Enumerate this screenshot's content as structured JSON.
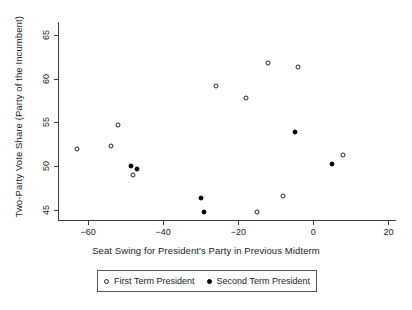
{
  "chart_data": {
    "type": "scatter",
    "title": "",
    "xlabel": "Seat Swing for President's Party in Previous Midterm",
    "ylabel": "Two-Party Vote Share (Party of the Incumbent)",
    "xlim": [
      -68,
      22
    ],
    "ylim": [
      43.8,
      66.5
    ],
    "xticks": [
      -60,
      -40,
      -20,
      0,
      20
    ],
    "xticklabels": [
      "−60",
      "−40",
      "−20",
      "0",
      "20"
    ],
    "yticks": [
      45,
      50,
      55,
      60,
      65
    ],
    "yticklabels": [
      "45",
      "50",
      "55",
      "60",
      "65"
    ],
    "grid": false,
    "legend_position": "below-axes",
    "series": [
      {
        "name": "First Term President",
        "marker": "open-circle",
        "color": "#222222",
        "points": [
          {
            "x": -63.0,
            "y": 51.9
          },
          {
            "x": -54.0,
            "y": 52.3
          },
          {
            "x": -52.0,
            "y": 54.7
          },
          {
            "x": -48.0,
            "y": 49.0
          },
          {
            "x": -26.0,
            "y": 59.2
          },
          {
            "x": -18.0,
            "y": 57.8
          },
          {
            "x": -12.0,
            "y": 61.8
          },
          {
            "x": -4.0,
            "y": 61.3
          },
          {
            "x": -8.0,
            "y": 46.5
          },
          {
            "x": -15.0,
            "y": 44.7
          },
          {
            "x": 8.0,
            "y": 51.2
          }
        ]
      },
      {
        "name": "Second Term President",
        "marker": "filled-circle",
        "color": "#000000",
        "points": [
          {
            "x": -48.5,
            "y": 50.0
          },
          {
            "x": -47.0,
            "y": 49.6
          },
          {
            "x": -30.0,
            "y": 46.3
          },
          {
            "x": -29.0,
            "y": 44.7
          },
          {
            "x": -5.0,
            "y": 53.9
          },
          {
            "x": 5.0,
            "y": 50.2
          }
        ]
      }
    ]
  },
  "legend": {
    "entries": [
      {
        "label": "First Term President",
        "marker": "open-circle"
      },
      {
        "label": "Second Term President",
        "marker": "filled-circle"
      }
    ]
  }
}
